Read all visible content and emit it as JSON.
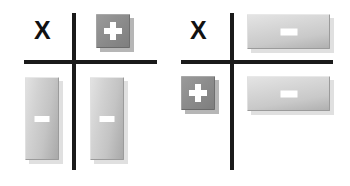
{
  "figure": {
    "background_color": "#ffffff",
    "axis_color": "#1a1a1a",
    "panel_count": 2
  },
  "palette": {
    "plus_button_face": "#8d8d8d",
    "minus_button_face": "#c4c4c4",
    "glyph_color": "#ffffff",
    "shadow_color": "#b9b9b9",
    "label_color": "#111111"
  },
  "panels": [
    {
      "id": "left",
      "axis_label_top_left": "X",
      "widgets": [
        {
          "name": "plus-button",
          "quadrant": "top-right",
          "glyph": "plus-icon",
          "glyph_text": "+",
          "shape": "square",
          "size": "small"
        },
        {
          "name": "minus-button-1",
          "quadrant": "bottom-left",
          "glyph": "minus-icon",
          "glyph_text": "−",
          "shape": "vertical-bar",
          "size": "tall"
        },
        {
          "name": "minus-button-2",
          "quadrant": "bottom-right",
          "glyph": "minus-icon",
          "glyph_text": "−",
          "shape": "vertical-bar",
          "size": "tall"
        }
      ]
    },
    {
      "id": "right",
      "axis_label_top_left": "X",
      "widgets": [
        {
          "name": "minus-button-1",
          "quadrant": "top-right",
          "glyph": "minus-icon",
          "glyph_text": "−",
          "shape": "horizontal-bar",
          "size": "wide"
        },
        {
          "name": "plus-button",
          "quadrant": "bottom-left",
          "glyph": "plus-icon",
          "glyph_text": "+",
          "shape": "square",
          "size": "small"
        },
        {
          "name": "minus-button-2",
          "quadrant": "bottom-right",
          "glyph": "minus-icon",
          "glyph_text": "−",
          "shape": "horizontal-bar",
          "size": "wide"
        }
      ]
    }
  ]
}
